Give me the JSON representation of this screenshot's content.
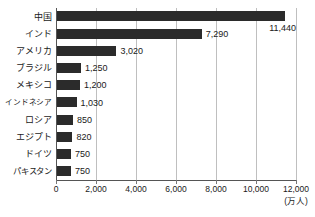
{
  "chart_data": {
    "type": "bar",
    "orientation": "horizontal",
    "title": "",
    "xlabel": "(万人)",
    "ylabel": "",
    "xlim": [
      0,
      12000
    ],
    "xticks": [
      "0",
      "2,000",
      "4,000",
      "6,000",
      "8,000",
      "10,000",
      "12,000"
    ],
    "xtick_values": [
      0,
      2000,
      4000,
      6000,
      8000,
      10000,
      12000
    ],
    "grid": "vertical",
    "legend": "none",
    "bar_color": "#2b2b2b",
    "grid_color": "#bfbfbf",
    "axis_color": "#555555",
    "background": "#ffffff",
    "categories": [
      "中国",
      "インド",
      "アメリカ",
      "ブラジル",
      "メキシコ",
      "インドネシア",
      "ロシア",
      "エジプト",
      "ドイツ",
      "パキスタン"
    ],
    "values": [
      11440,
      7290,
      3020,
      1250,
      1200,
      1030,
      850,
      820,
      750,
      750
    ],
    "value_labels": [
      "11,440",
      "7,290",
      "3,020",
      "1,250",
      "1,200",
      "1,030",
      "850",
      "820",
      "750",
      "750"
    ]
  }
}
